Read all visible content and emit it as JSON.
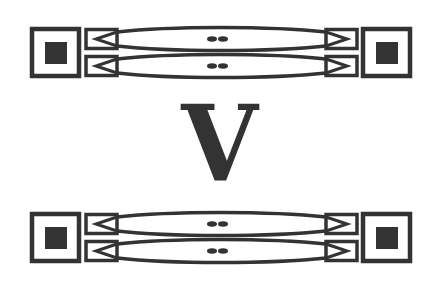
{
  "diagram": {
    "center_label": "V",
    "ink_color": "#333333",
    "background_color": "#ffffff",
    "rows": [
      {
        "name": "top-connector-assembly",
        "lanes": 2
      },
      {
        "name": "bottom-connector-assembly",
        "lanes": 2
      }
    ],
    "icons": {
      "end_terminal": "square-terminal-icon",
      "connector": "arrow-connector-icon",
      "link": "lens-link-icon",
      "midpoint": "double-dot-icon"
    }
  }
}
